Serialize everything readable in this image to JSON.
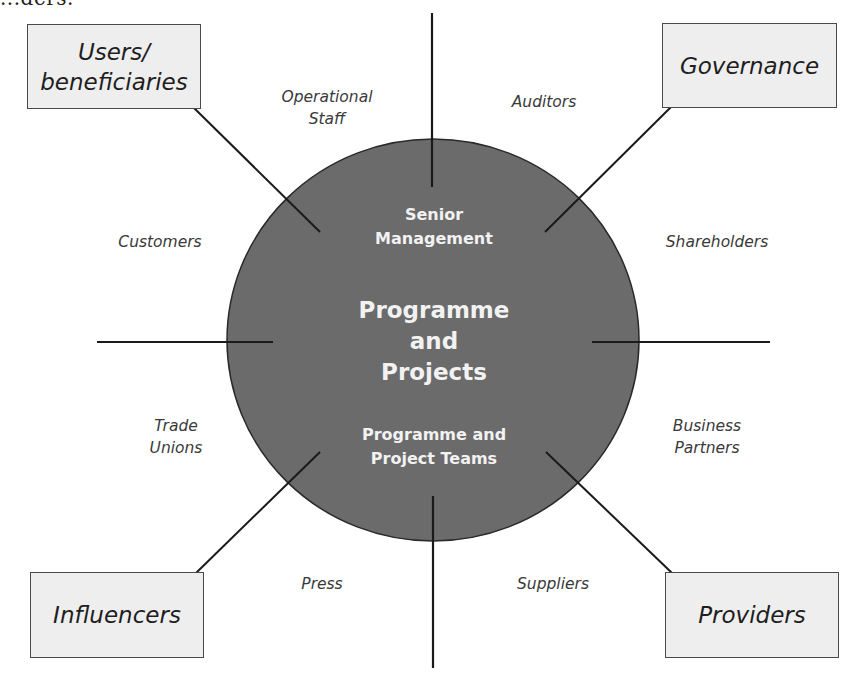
{
  "diagram": {
    "title_fragment": "...ders.",
    "center": {
      "title": "Programme\nand\nProjects",
      "top_label": "Senior\nManagement",
      "bottom_label": "Programme and\nProject Teams",
      "fill_color": "#6b6b6b",
      "stroke_color": "#2a2a2a"
    },
    "quadrant_boxes": {
      "top_left": "Users/\nbeneficiaries",
      "top_right": "Governance",
      "bottom_left": "Influencers",
      "bottom_right": "Providers",
      "fill_color": "#eeeeee"
    },
    "stakeholders": {
      "operational_staff": "Operational\nStaff",
      "auditors": "Auditors",
      "customers": "Customers",
      "shareholders": "Shareholders",
      "trade_unions": "Trade\nUnions",
      "business_partners": "Business\nPartners",
      "press": "Press",
      "suppliers": "Suppliers"
    },
    "line_color": "#1a1a1a"
  }
}
